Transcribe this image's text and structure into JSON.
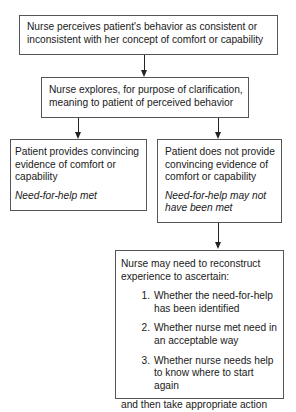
{
  "diagram": {
    "type": "flowchart",
    "nodes": {
      "perceive": {
        "text": "Nurse perceives patient's behavior as consistent or inconsistent with her concept of comfort or capability"
      },
      "explore": {
        "text": "Nurse explores, for purpose of clarification, meaning to patient of perceived behavior"
      },
      "convincing": {
        "text": "Patient provides convincing evidence of comfort or capability",
        "outcome": "Need-for-help met"
      },
      "not_convincing": {
        "text": "Patient does not provide convincing evidence of comfort or capability",
        "outcome": "Need-for-help may not have been met"
      },
      "reconstruct": {
        "intro": "Nurse may need to reconstruct experience to ascertain:",
        "items": [
          {
            "num": "1.",
            "text": "Whether the need-for-help has been identified"
          },
          {
            "num": "2.",
            "text": "Whether nurse met need in an acceptable way"
          },
          {
            "num": "3.",
            "text": "Whether nurse needs help to know where to start again"
          }
        ],
        "closing": "and then take appropriate action"
      }
    },
    "edges": [
      {
        "from": "perceive",
        "to": "explore"
      },
      {
        "from": "explore",
        "to": "convincing"
      },
      {
        "from": "explore",
        "to": "not_convincing"
      },
      {
        "from": "not_convincing",
        "to": "reconstruct"
      }
    ]
  }
}
